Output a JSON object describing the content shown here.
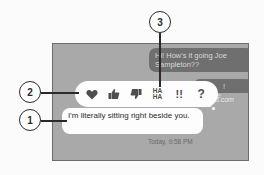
{
  "conversation": {
    "incoming_messages": [
      {
        "text": "Hi! How's it going Joe Sampleton??"
      },
      {
        "text": "! Where"
      }
    ],
    "partial_link_text": "ud.com",
    "outgoing_message": {
      "text": "I'm literally sitting right beside you."
    },
    "timestamp": "Today, 9:58 PM"
  },
  "reaction_bar": {
    "reactions": [
      {
        "name": "heart",
        "glyph": "♥"
      },
      {
        "name": "thumbs-up",
        "glyph": "👍"
      },
      {
        "name": "thumbs-down",
        "glyph": "👎"
      },
      {
        "name": "haha",
        "line1": "HA",
        "line2": "HA"
      },
      {
        "name": "exclamation",
        "glyph": "!!"
      },
      {
        "name": "question",
        "glyph": "?"
      }
    ]
  },
  "callouts": [
    {
      "label": "1"
    },
    {
      "label": "2"
    },
    {
      "label": "3"
    }
  ]
}
